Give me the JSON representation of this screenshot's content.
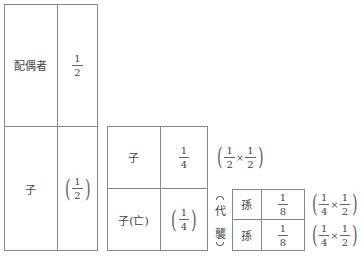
{
  "left_table": {
    "rows": [
      {
        "heir": "配偶者",
        "share": {
          "num": "1",
          "den": "2"
        },
        "parenthesized": false
      },
      {
        "heir": "子",
        "share": {
          "num": "1",
          "den": "2"
        },
        "parenthesized": true
      }
    ]
  },
  "middle_table": {
    "rows": [
      {
        "heir": "子",
        "share": {
          "num": "1",
          "den": "4"
        },
        "parenthesized": false
      },
      {
        "heir": "子(亡)",
        "share": {
          "num": "1",
          "den": "4"
        },
        "parenthesized": true
      }
    ],
    "calculation": {
      "a": {
        "num": "1",
        "den": "2"
      },
      "op": "×",
      "b": {
        "num": "1",
        "den": "2"
      }
    }
  },
  "substitution_label": {
    "chars": [
      "代",
      "襲"
    ]
  },
  "right_table": {
    "rows": [
      {
        "heir": "孫",
        "share": {
          "num": "1",
          "den": "8"
        },
        "calculation": {
          "a": {
            "num": "1",
            "den": "4"
          },
          "op": "×",
          "b": {
            "num": "1",
            "den": "2"
          }
        }
      },
      {
        "heir": "孫",
        "share": {
          "num": "1",
          "den": "8"
        },
        "calculation": {
          "a": {
            "num": "1",
            "den": "4"
          },
          "op": "×",
          "b": {
            "num": "1",
            "den": "2"
          }
        }
      }
    ]
  }
}
